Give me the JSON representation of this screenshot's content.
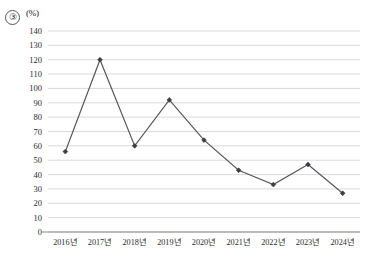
{
  "figure": {
    "item_marker": "③",
    "unit_label": "(%)"
  },
  "chart_data": {
    "type": "line",
    "title": "",
    "subtitle": "",
    "xlabel": "",
    "ylabel": "(%)",
    "categories": [
      "2016년",
      "2017년",
      "2018년",
      "2019년",
      "2020년",
      "2021년",
      "2022년",
      "2023년",
      "2024년"
    ],
    "values": [
      56,
      120,
      60,
      92,
      64,
      43,
      33,
      47,
      27
    ],
    "series": [
      {
        "name": "",
        "values": [
          56,
          120,
          60,
          92,
          64,
          43,
          33,
          47,
          27
        ]
      }
    ],
    "ylim": [
      0,
      140
    ],
    "ytick_step": 10,
    "yticks": [
      0,
      10,
      20,
      30,
      40,
      50,
      60,
      70,
      80,
      90,
      100,
      110,
      120,
      130,
      140
    ],
    "ytick_labels": [
      "0",
      "10",
      "20",
      "30",
      "40",
      "50",
      "60",
      "70",
      "80",
      "90",
      "100",
      "110",
      "120",
      "130",
      "140"
    ],
    "grid": true,
    "grid_axis": "y",
    "legend": false,
    "legend_position": "none",
    "marker": "diamond",
    "line_color": "#59595e",
    "marker_color": "#3d3d42",
    "grid_color": "#c9c9c9",
    "axis_color": "#8a8a8a",
    "background": "#ffffff"
  }
}
